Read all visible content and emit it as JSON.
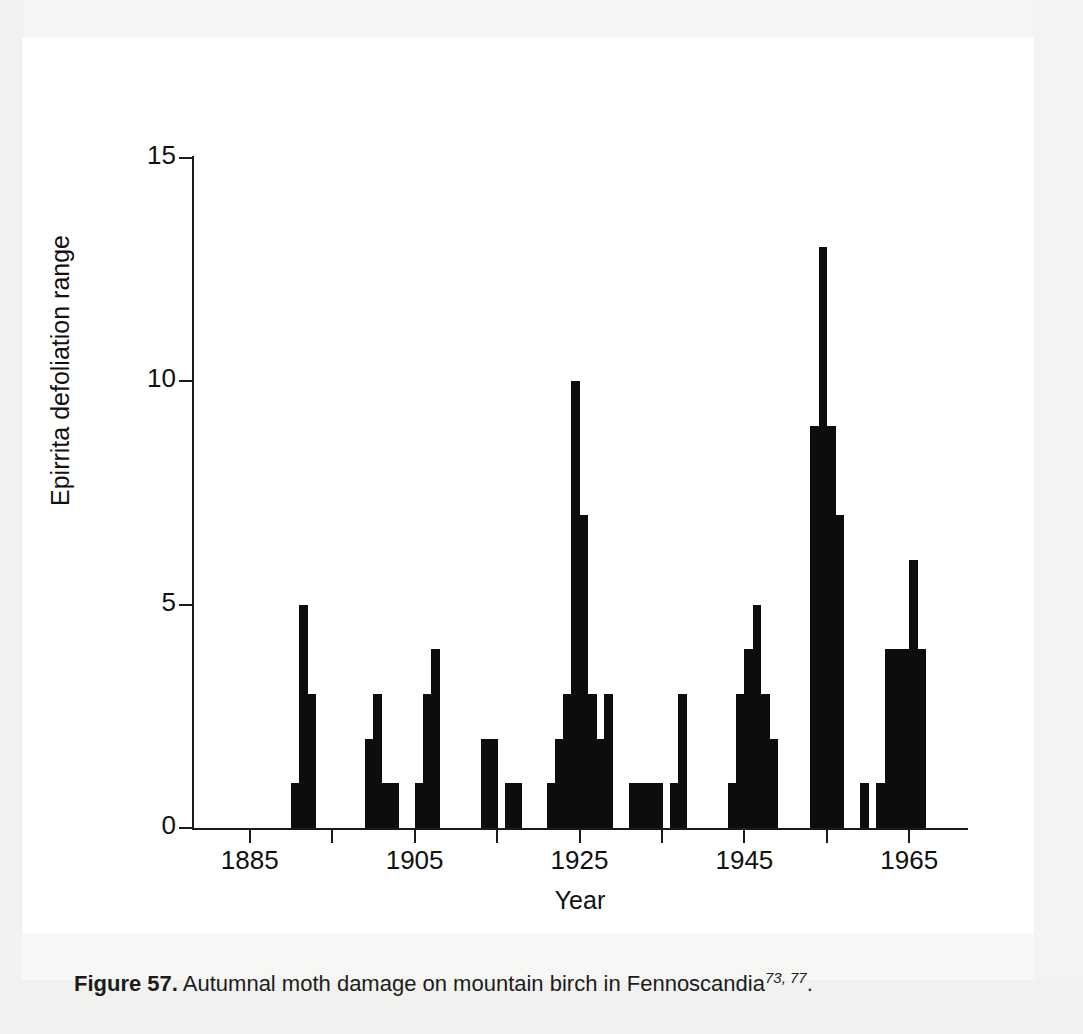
{
  "caption": {
    "label": "Figure 57.",
    "text": " Autumnal moth damage on mountain birch in Fennoscandia",
    "refs": "73, 77",
    "end": "."
  },
  "chart_data": {
    "type": "bar",
    "title": "",
    "xlabel": "Year",
    "ylabel": "Epirrita defoliation range",
    "xlim": [
      1878,
      1972
    ],
    "ylim": [
      0,
      15
    ],
    "yticks": [
      0,
      5,
      10,
      15
    ],
    "ytick_labels": [
      "0",
      "5",
      "10",
      "15"
    ],
    "xticks": [
      1885,
      1895,
      1905,
      1915,
      1925,
      1935,
      1945,
      1955,
      1965
    ],
    "xtick_labels": [
      "1885",
      "",
      "1905",
      "",
      "1925",
      "",
      "1945",
      "",
      "1965"
    ],
    "grid": false,
    "legend": null,
    "bar_color": "#0d0d0d",
    "axis_color": "#1a1a1a",
    "x": [
      1890,
      1891,
      1892,
      1899,
      1900,
      1901,
      1902,
      1905,
      1906,
      1907,
      1913,
      1914,
      1916,
      1917,
      1921,
      1922,
      1923,
      1924,
      1925,
      1926,
      1927,
      1928,
      1931,
      1932,
      1933,
      1934,
      1936,
      1937,
      1943,
      1944,
      1945,
      1946,
      1947,
      1948,
      1953,
      1954,
      1955,
      1956,
      1959,
      1961,
      1962,
      1963,
      1964,
      1965,
      1966
    ],
    "values": [
      1,
      5,
      3,
      2,
      3,
      1,
      1,
      1,
      3,
      4,
      2,
      2,
      1,
      1,
      1,
      2,
      3,
      10,
      7,
      3,
      2,
      3,
      1,
      1,
      1,
      1,
      1,
      3,
      1,
      3,
      4,
      5,
      3,
      2,
      9,
      13,
      9,
      7,
      1,
      1,
      4,
      4,
      4,
      6,
      4
    ]
  }
}
